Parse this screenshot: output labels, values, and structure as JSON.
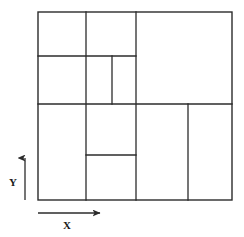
{
  "figure": {
    "background_color": "#ffffff",
    "line_color": "#2b2b2b",
    "label_color": "#1a1a1a",
    "outer_boundary": {
      "name": "outer-rectangle",
      "x1": 38,
      "y1": 12,
      "x2": 232,
      "y2": 200
    },
    "partition_lines": [
      {
        "name": "vertical-divider-left",
        "orientation": "vertical",
        "x": 86,
        "y1": 12,
        "y2": 200
      },
      {
        "name": "vertical-divider-middle",
        "orientation": "vertical",
        "x": 136,
        "y1": 12,
        "y2": 200
      },
      {
        "name": "vertical-divider-short-upper",
        "orientation": "vertical",
        "x": 112,
        "y1": 56,
        "y2": 104
      },
      {
        "name": "vertical-divider-lower-right",
        "orientation": "vertical",
        "x": 188,
        "y1": 104,
        "y2": 200
      },
      {
        "name": "horizontal-divider-upper",
        "orientation": "horizontal",
        "y": 56,
        "x1": 38,
        "x2": 136
      },
      {
        "name": "horizontal-divider-main",
        "orientation": "horizontal",
        "y": 104,
        "x1": 38,
        "x2": 232
      },
      {
        "name": "horizontal-divider-lower",
        "orientation": "horizontal",
        "y": 155,
        "x1": 86,
        "x2": 136
      }
    ],
    "axes": {
      "y_axis": {
        "label": "Y",
        "label_x": 13,
        "label_y": 186,
        "arrow_x": 25,
        "arrow_y_start": 200,
        "arrow_y_end": 155
      },
      "x_axis": {
        "label": "X",
        "label_x": 64,
        "label_y": 229,
        "arrow_y": 213,
        "arrow_x_start": 38,
        "arrow_x_end": 104
      }
    }
  },
  "chart_data": {
    "type": "diagram",
    "title": "",
    "xlabel": "X",
    "ylabel": "Y",
    "cells": [
      {
        "id": "cell-1",
        "x1": 38,
        "y1": 12,
        "x2": 86,
        "y2": 56
      },
      {
        "id": "cell-2",
        "x1": 86,
        "y1": 12,
        "x2": 136,
        "y2": 56
      },
      {
        "id": "cell-3",
        "x1": 136,
        "y1": 12,
        "x2": 232,
        "y2": 104
      },
      {
        "id": "cell-4",
        "x1": 38,
        "y1": 56,
        "x2": 86,
        "y2": 104
      },
      {
        "id": "cell-5",
        "x1": 86,
        "y1": 56,
        "x2": 112,
        "y2": 104
      },
      {
        "id": "cell-6",
        "x1": 112,
        "y1": 56,
        "x2": 136,
        "y2": 104
      },
      {
        "id": "cell-7",
        "x1": 38,
        "y1": 104,
        "x2": 86,
        "y2": 200
      },
      {
        "id": "cell-8",
        "x1": 86,
        "y1": 104,
        "x2": 136,
        "y2": 155
      },
      {
        "id": "cell-9",
        "x1": 86,
        "y1": 155,
        "x2": 136,
        "y2": 200
      },
      {
        "id": "cell-10",
        "x1": 136,
        "y1": 104,
        "x2": 188,
        "y2": 200
      },
      {
        "id": "cell-11",
        "x1": 188,
        "y1": 104,
        "x2": 232,
        "y2": 200
      }
    ],
    "cell_count": 11,
    "grid": false,
    "legend": null
  }
}
